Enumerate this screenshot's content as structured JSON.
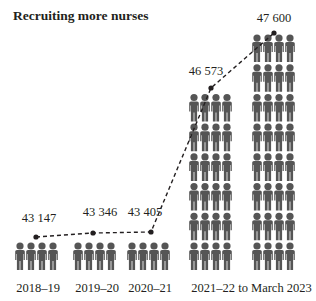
{
  "title": "Recruiting more nurses",
  "chart_data": {
    "type": "line",
    "subtype": "pictogram-with-line",
    "title": "Recruiting more nurses",
    "xlabel": "",
    "ylabel": "",
    "categories": [
      "2018–19",
      "2019–20",
      "2020–21",
      "2021–22",
      "to March 2023"
    ],
    "series": [
      {
        "name": "Nurses",
        "values": [
          43147,
          43346,
          43405,
          46573,
          47600
        ]
      }
    ],
    "value_labels": [
      "43 147",
      "43 346",
      "43 405",
      "46 573",
      "47 600"
    ],
    "pictogram_rows": [
      1,
      1,
      1,
      6,
      8
    ],
    "figures_per_row": 4,
    "line_style": "dashed",
    "grid": false,
    "legend": "none",
    "colors": {
      "figure": "#555555",
      "line": "#231f20",
      "text": "#231f20"
    }
  },
  "labels": {
    "values": [
      "43 147",
      "43 346",
      "43 405",
      "46 573",
      "47 600"
    ],
    "categories": [
      "2018–19",
      "2019–20",
      "2020–21",
      "2021–22",
      "to March 2023"
    ]
  }
}
